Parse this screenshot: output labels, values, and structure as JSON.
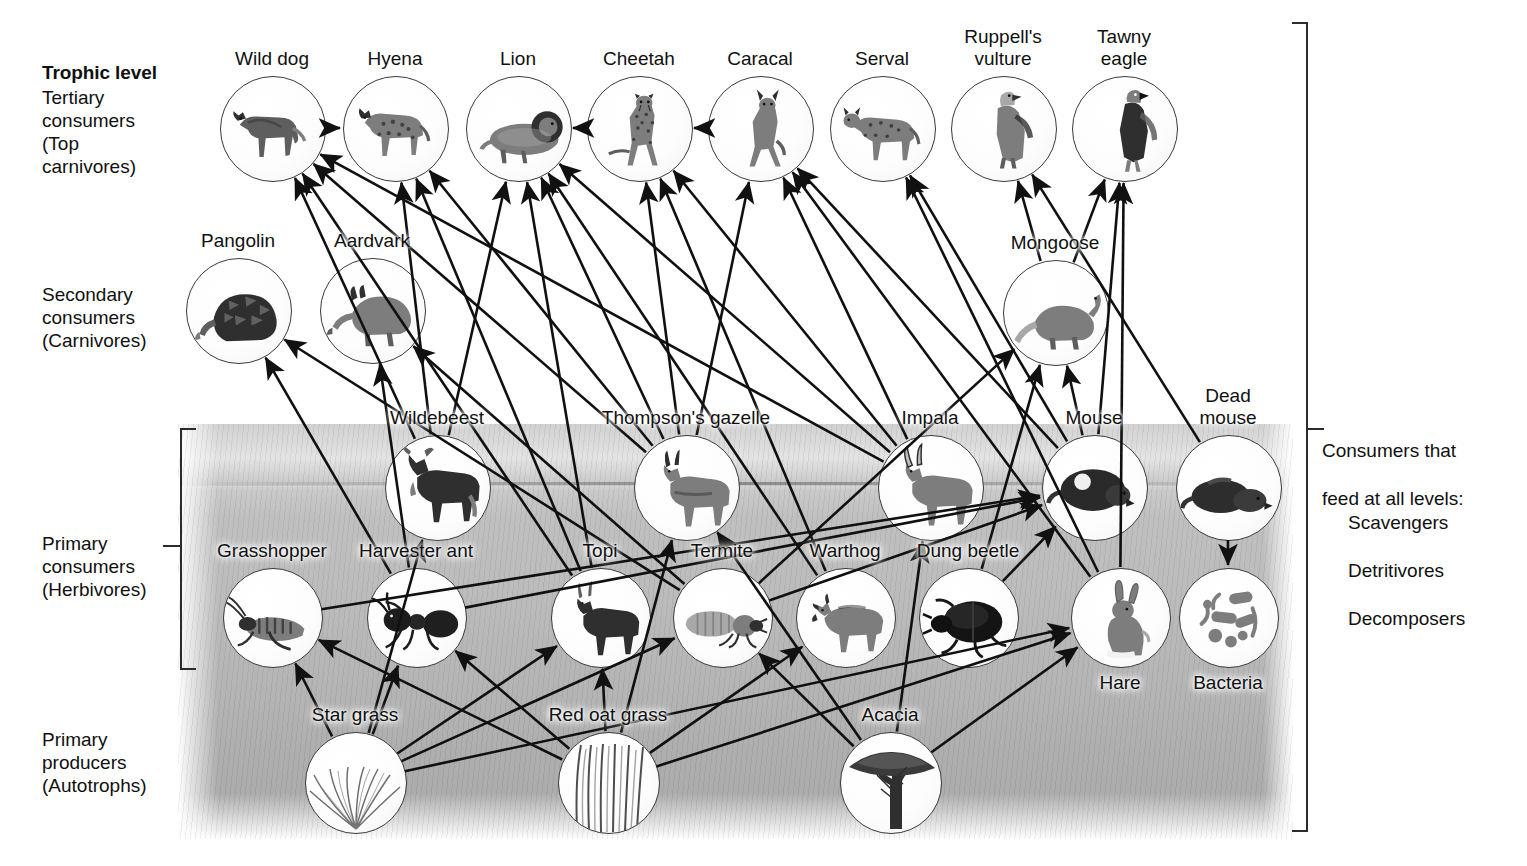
{
  "figure": {
    "trophic_heading": "Trophic level",
    "levels": [
      {
        "id": "tertiary",
        "label": "Tertiary\nconsumers\n(Top\ncarnivores)"
      },
      {
        "id": "secondary",
        "label": "Secondary\nconsumers\n(Carnivores)"
      },
      {
        "id": "primary",
        "label": "Primary\nconsumers\n(Herbivores)"
      },
      {
        "id": "producers",
        "label": "Primary\nproducers\n(Autotrophs)"
      }
    ],
    "side_note": {
      "line1": "Consumers that",
      "line2": "feed at all levels:",
      "items": [
        "Scavengers",
        "Detritivores",
        "Decomposers"
      ]
    }
  },
  "chart_data": {
    "type": "diagram",
    "subtype": "food-web",
    "trophic_levels": [
      "Primary producers (Autotrophs)",
      "Primary consumers (Herbivores)",
      "Secondary consumers (Carnivores)",
      "Tertiary consumers (Top carnivores)"
    ],
    "nodes": [
      {
        "id": "wilddog",
        "label": "Wild dog",
        "level": "tertiary",
        "x": 272,
        "y": 128,
        "r": 52,
        "art": "wild-dog"
      },
      {
        "id": "hyena",
        "label": "Hyena",
        "level": "tertiary",
        "x": 395,
        "y": 128,
        "r": 52,
        "art": "hyena"
      },
      {
        "id": "lion",
        "label": "Lion",
        "level": "tertiary",
        "x": 518,
        "y": 128,
        "r": 52,
        "art": "lion"
      },
      {
        "id": "cheetah",
        "label": "Cheetah",
        "level": "tertiary",
        "x": 639,
        "y": 128,
        "r": 52,
        "art": "cheetah"
      },
      {
        "id": "caracal",
        "label": "Caracal",
        "level": "tertiary",
        "x": 760,
        "y": 128,
        "r": 52,
        "art": "caracal"
      },
      {
        "id": "serval",
        "label": "Serval",
        "level": "tertiary",
        "x": 882,
        "y": 128,
        "r": 52,
        "art": "serval"
      },
      {
        "id": "vulture",
        "label": "Ruppell's\nvulture",
        "level": "tertiary",
        "x": 1003,
        "y": 128,
        "r": 52,
        "art": "vulture"
      },
      {
        "id": "eagle",
        "label": "Tawny\neagle",
        "level": "tertiary",
        "x": 1124,
        "y": 128,
        "r": 52,
        "art": "eagle"
      },
      {
        "id": "pangolin",
        "label": "Pangolin",
        "level": "secondary",
        "x": 238,
        "y": 310,
        "r": 52,
        "art": "pangolin"
      },
      {
        "id": "aardvark",
        "label": "Aardvark",
        "level": "secondary",
        "x": 372,
        "y": 310,
        "r": 52,
        "art": "aardvark"
      },
      {
        "id": "mongoose",
        "label": "Mongoose",
        "level": "secondary",
        "x": 1055,
        "y": 312,
        "r": 52,
        "art": "mongoose"
      },
      {
        "id": "wildebeest",
        "label": "Wildebeest",
        "level": "primary",
        "x": 437,
        "y": 487,
        "r": 52,
        "art": "wildebeest"
      },
      {
        "id": "gazelle",
        "label": "Thompson's gazelle",
        "level": "primary",
        "x": 686,
        "y": 487,
        "r": 52,
        "art": "gazelle"
      },
      {
        "id": "impala",
        "label": "Impala",
        "level": "primary",
        "x": 930,
        "y": 487,
        "r": 52,
        "art": "impala"
      },
      {
        "id": "mouse",
        "label": "Mouse",
        "level": "primary",
        "x": 1094,
        "y": 487,
        "r": 52,
        "art": "mouse"
      },
      {
        "id": "deadmouse",
        "label": "Dead\nmouse",
        "level": "primary",
        "x": 1228,
        "y": 487,
        "r": 52,
        "art": "dead-mouse"
      },
      {
        "id": "grasshopper",
        "label": "Grasshopper",
        "level": "primary",
        "x": 272,
        "y": 617,
        "r": 49,
        "art": "grasshopper"
      },
      {
        "id": "ant",
        "label": "Harvester ant",
        "level": "primary",
        "x": 416,
        "y": 617,
        "r": 49,
        "art": "ant"
      },
      {
        "id": "topi",
        "label": "Topi",
        "level": "primary",
        "x": 600,
        "y": 617,
        "r": 49,
        "art": "topi"
      },
      {
        "id": "termite",
        "label": "Termite",
        "level": "primary",
        "x": 722,
        "y": 617,
        "r": 49,
        "art": "termite"
      },
      {
        "id": "warthog",
        "label": "Warthog",
        "level": "primary",
        "x": 845,
        "y": 617,
        "r": 49,
        "art": "warthog"
      },
      {
        "id": "dungbeetle",
        "label": "Dung beetle",
        "level": "primary",
        "x": 968,
        "y": 617,
        "r": 49,
        "art": "dung-beetle"
      },
      {
        "id": "hare",
        "label": "Hare",
        "level": "primary",
        "x": 1120,
        "y": 617,
        "r": 49,
        "art": "hare"
      },
      {
        "id": "bacteria",
        "label": "Bacteria",
        "level": "primary",
        "x": 1228,
        "y": 617,
        "r": 49,
        "art": "bacteria"
      },
      {
        "id": "stargrass",
        "label": "Star grass",
        "level": "producers",
        "x": 355,
        "y": 782,
        "r": 50,
        "art": "star-grass"
      },
      {
        "id": "redoat",
        "label": "Red oat grass",
        "level": "producers",
        "x": 608,
        "y": 782,
        "r": 50,
        "art": "red-oat-grass"
      },
      {
        "id": "acacia",
        "label": "Acacia",
        "level": "producers",
        "x": 890,
        "y": 782,
        "r": 50,
        "art": "acacia"
      }
    ],
    "links": [
      {
        "from": "stargrass",
        "to": "grasshopper"
      },
      {
        "from": "stargrass",
        "to": "ant"
      },
      {
        "from": "stargrass",
        "to": "topi"
      },
      {
        "from": "stargrass",
        "to": "wildebeest"
      },
      {
        "from": "stargrass",
        "to": "termite"
      },
      {
        "from": "stargrass",
        "to": "hare"
      },
      {
        "from": "redoat",
        "to": "grasshopper"
      },
      {
        "from": "redoat",
        "to": "ant"
      },
      {
        "from": "redoat",
        "to": "topi"
      },
      {
        "from": "redoat",
        "to": "gazelle"
      },
      {
        "from": "redoat",
        "to": "warthog"
      },
      {
        "from": "redoat",
        "to": "hare"
      },
      {
        "from": "acacia",
        "to": "gazelle"
      },
      {
        "from": "acacia",
        "to": "impala"
      },
      {
        "from": "acacia",
        "to": "termite"
      },
      {
        "from": "acacia",
        "to": "hare"
      },
      {
        "from": "grasshopper",
        "to": "mouse"
      },
      {
        "from": "ant",
        "to": "aardvark"
      },
      {
        "from": "ant",
        "to": "pangolin"
      },
      {
        "from": "ant",
        "to": "mouse"
      },
      {
        "from": "termite",
        "to": "aardvark"
      },
      {
        "from": "termite",
        "to": "pangolin"
      },
      {
        "from": "termite",
        "to": "mongoose"
      },
      {
        "from": "termite",
        "to": "mouse"
      },
      {
        "from": "dungbeetle",
        "to": "mongoose"
      },
      {
        "from": "dungbeetle",
        "to": "mouse"
      },
      {
        "from": "warthog",
        "to": "lion"
      },
      {
        "from": "warthog",
        "to": "cheetah"
      },
      {
        "from": "topi",
        "to": "lion"
      },
      {
        "from": "topi",
        "to": "hyena"
      },
      {
        "from": "topi",
        "to": "wilddog"
      },
      {
        "from": "wildebeest",
        "to": "lion"
      },
      {
        "from": "wildebeest",
        "to": "hyena"
      },
      {
        "from": "wildebeest",
        "to": "wilddog"
      },
      {
        "from": "gazelle",
        "to": "lion"
      },
      {
        "from": "gazelle",
        "to": "cheetah"
      },
      {
        "from": "gazelle",
        "to": "wilddog"
      },
      {
        "from": "gazelle",
        "to": "hyena"
      },
      {
        "from": "gazelle",
        "to": "caracal"
      },
      {
        "from": "impala",
        "to": "lion"
      },
      {
        "from": "impala",
        "to": "cheetah"
      },
      {
        "from": "impala",
        "to": "caracal"
      },
      {
        "from": "impala",
        "to": "wilddog"
      },
      {
        "from": "mouse",
        "to": "serval"
      },
      {
        "from": "mouse",
        "to": "caracal"
      },
      {
        "from": "mouse",
        "to": "eagle"
      },
      {
        "from": "mouse",
        "to": "mongoose"
      },
      {
        "from": "hare",
        "to": "serval"
      },
      {
        "from": "hare",
        "to": "caracal"
      },
      {
        "from": "hare",
        "to": "eagle"
      },
      {
        "from": "mongoose",
        "to": "vulture"
      },
      {
        "from": "mongoose",
        "to": "eagle"
      },
      {
        "from": "wilddog",
        "to": "hyena"
      },
      {
        "from": "cheetah",
        "to": "lion"
      },
      {
        "from": "caracal",
        "to": "cheetah"
      },
      {
        "from": "deadmouse",
        "to": "bacteria"
      },
      {
        "from": "deadmouse",
        "to": "vulture"
      }
    ]
  }
}
